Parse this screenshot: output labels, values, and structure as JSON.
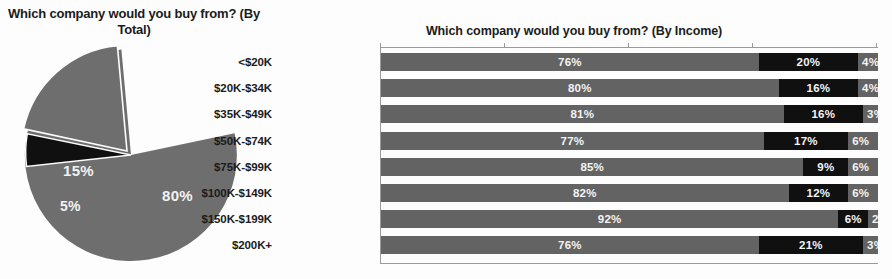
{
  "pie_panel": {
    "title": "Which company would you buy from? (By Total)"
  },
  "bar_panel": {
    "title": "Which company would you buy from? (By Income)"
  },
  "colors": {
    "segment_a": "#636363",
    "segment_b": "#101010",
    "segment_c": "#636363",
    "pie_main": "#6e6e6e",
    "pie_second": "#6e6e6e",
    "pie_third": "#101010",
    "label_text": "#f4f4f4",
    "axis": "#9a9a9a",
    "background": "#fdfdfd"
  },
  "chart_data": [
    {
      "type": "pie",
      "title": "Which company would you buy from? (By Total)",
      "categories": [
        "80%",
        "15%",
        "5%"
      ],
      "values": [
        80,
        15,
        5
      ],
      "labels": [
        "80%",
        "15%",
        "5%"
      ],
      "colors": [
        "#6e6e6e",
        "#6e6e6e",
        "#101010"
      ],
      "exploded_slice": "15%",
      "legend": "none"
    },
    {
      "type": "bar",
      "orientation": "horizontal",
      "stacked": true,
      "title": "Which company would you buy from? (By Income)",
      "xlabel": "",
      "ylabel": "",
      "xlim": [
        0,
        100
      ],
      "xticks": [
        0,
        25,
        50,
        75,
        100
      ],
      "grid": false,
      "legend": "none",
      "categories": [
        "<$20K",
        "$20K-$34K",
        "$35K-$49K",
        "$50K-$74K",
        "$75K-$99K",
        "$100K-$149K",
        "$150K-$199K",
        "$200K+"
      ],
      "series": [
        {
          "name": "segment-a",
          "values": [
            76,
            80,
            81,
            77,
            85,
            82,
            92,
            76
          ]
        },
        {
          "name": "segment-b",
          "values": [
            20,
            16,
            16,
            17,
            9,
            12,
            6,
            21
          ]
        },
        {
          "name": "segment-c",
          "values": [
            4,
            4,
            3,
            6,
            6,
            6,
            2,
            3
          ]
        }
      ],
      "rows": [
        {
          "category": "<$20K",
          "a": 76,
          "b": 20,
          "c": 4,
          "a_label": "76%",
          "b_label": "20%",
          "c_label": "4%"
        },
        {
          "category": "$20K-$34K",
          "a": 80,
          "b": 16,
          "c": 4,
          "a_label": "80%",
          "b_label": "16%",
          "c_label": "4%"
        },
        {
          "category": "$35K-$49K",
          "a": 81,
          "b": 16,
          "c": 3,
          "a_label": "81%",
          "b_label": "16%",
          "c_label": "3%"
        },
        {
          "category": "$50K-$74K",
          "a": 77,
          "b": 17,
          "c": 6,
          "a_label": "77%",
          "b_label": "17%",
          "c_label": "6%"
        },
        {
          "category": "$75K-$99K",
          "a": 85,
          "b": 9,
          "c": 6,
          "a_label": "85%",
          "b_label": "9%",
          "c_label": "6%"
        },
        {
          "category": "$100K-$149K",
          "a": 82,
          "b": 12,
          "c": 6,
          "a_label": "82%",
          "b_label": "12%",
          "c_label": "6%"
        },
        {
          "category": "$150K-$199K",
          "a": 92,
          "b": 6,
          "c": 2,
          "a_label": "92%",
          "b_label": "6%",
          "c_label": "2%"
        },
        {
          "category": "$200K+",
          "a": 76,
          "b": 21,
          "c": 3,
          "a_label": "76%",
          "b_label": "21%",
          "c_label": "3%"
        }
      ]
    }
  ]
}
